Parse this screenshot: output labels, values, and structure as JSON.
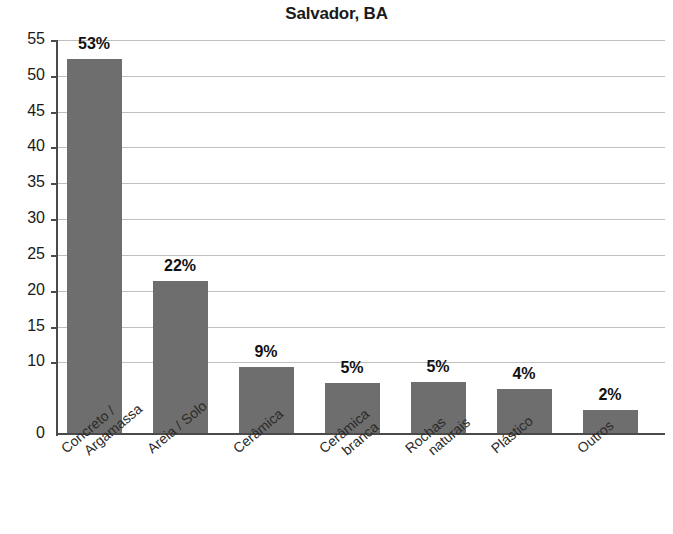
{
  "chart_data": {
    "type": "bar",
    "title": "Salvador, BA",
    "xlabel": "",
    "ylabel": "",
    "ylim": [
      0,
      55
    ],
    "grid": true,
    "legend": "none",
    "orientation": "vertical",
    "bar_color": "#6e6e6e",
    "value_suffix": "%",
    "categories": [
      "Concreto / Argamassa",
      "Areia / Solo",
      "Cerâmica",
      "Cerâmica branca",
      "Rochas naturais",
      "Plástico",
      "Outros"
    ],
    "category_lines": [
      [
        "Concreto /",
        "Argamassa"
      ],
      [
        "Areia / Solo"
      ],
      [
        "Cerâmica"
      ],
      [
        "Cerâmica",
        "branca"
      ],
      [
        "Rochas",
        "naturais"
      ],
      [
        "Plástico"
      ],
      [
        "Outros"
      ]
    ],
    "values": [
      52.3,
      21.3,
      9.3,
      7.1,
      7.2,
      6.3,
      3.3
    ],
    "data_labels": [
      "53%",
      "22%",
      "9%",
      "5%",
      "5%",
      "4%",
      "2%"
    ],
    "yticks": [
      0,
      10,
      15,
      20,
      25,
      30,
      35,
      40,
      45,
      50,
      55
    ],
    "ytick_labels": [
      "0",
      "10",
      "15",
      "20",
      "25",
      "30",
      "35",
      "40",
      "45",
      "50",
      "55"
    ],
    "gridline_values": [
      10,
      15,
      20,
      25,
      30,
      35,
      40,
      45,
      50,
      55
    ]
  }
}
